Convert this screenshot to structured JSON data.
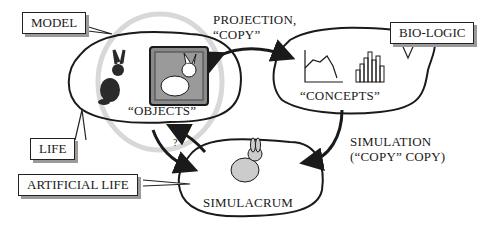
{
  "diagram": {
    "callouts": {
      "model": "MODEL",
      "bio_logic": "BIO-LOGIC",
      "life": "LIFE",
      "artificial_life": "ARTIFICIAL LIFE"
    },
    "nodes": {
      "objects": "“OBJECTS”",
      "concepts": "“CONCEPTS”",
      "simulacrum": "SIMULACRUM"
    },
    "edges": {
      "projection_line1": "PROJECTION,",
      "projection_line2": "“COPY”",
      "simulation_line1": "SIMULATION",
      "simulation_line2": "(“COPY” COPY)",
      "question": "?"
    },
    "icons": [
      "rabbit-icon",
      "framed-rabbit-icon",
      "line-graph-icon",
      "bar-chart-icon",
      "textured-rabbit-icon"
    ],
    "colors": {
      "ink": "#1a1a1a",
      "shadow": "#9a9a9a",
      "halo": "#d8d8d8",
      "frame": "#777777"
    }
  }
}
